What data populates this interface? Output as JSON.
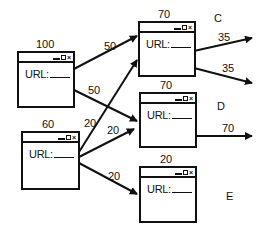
{
  "diagram": {
    "nodes": [
      {
        "id": "A",
        "letter": "",
        "score": "100",
        "url_label": "URL:"
      },
      {
        "id": "B",
        "letter": "",
        "score": "60",
        "url_label": "URL:"
      },
      {
        "id": "C",
        "letter": "C",
        "score": "70",
        "url_label": "URL:"
      },
      {
        "id": "D",
        "letter": "D",
        "score": "70",
        "url_label": "URL:"
      },
      {
        "id": "E",
        "letter": "E",
        "score": "20",
        "url_label": "URL:"
      }
    ],
    "edges": [
      {
        "from": "A",
        "to": "C",
        "weight": "50"
      },
      {
        "from": "A",
        "to": "D",
        "weight": "50"
      },
      {
        "from": "B",
        "to": "C",
        "weight": "20"
      },
      {
        "from": "B",
        "to": "D",
        "weight": "20"
      },
      {
        "from": "B",
        "to": "E",
        "weight": "20"
      },
      {
        "from": "C",
        "to": "out1",
        "weight": "35"
      },
      {
        "from": "C",
        "to": "out2",
        "weight": "35"
      },
      {
        "from": "D",
        "to": "out",
        "weight": "70"
      }
    ],
    "window_controls": {
      "minimize": "minimize-icon",
      "maximize": "maximize-icon",
      "close": "×"
    }
  }
}
